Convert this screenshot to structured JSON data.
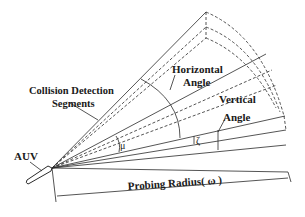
{
  "diagram": {
    "labels": {
      "horizontal_angle_line1": "Horizontal",
      "horizontal_angle_line2": "Angle",
      "collision_line1": "Collision Detection",
      "collision_line2": "Segments",
      "vertical_angle_line1": "Vertical",
      "vertical_angle_line2": "Angle",
      "auv": "AUV",
      "probing_radius": "Probing Radius( ω )"
    },
    "symbols": {
      "mu": "μ",
      "zeta": "ζ"
    },
    "colors": {
      "line": "#2a2a2a",
      "background": "#ffffff"
    }
  }
}
